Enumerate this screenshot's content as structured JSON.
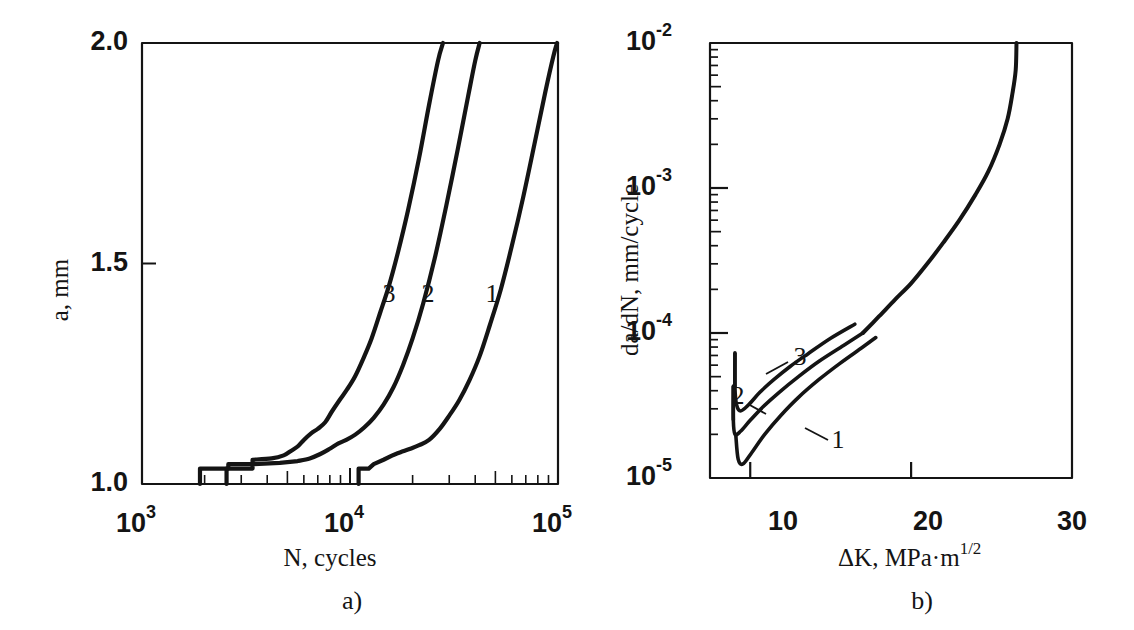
{
  "figure": {
    "width": 1134,
    "height": 630,
    "background": "#ffffff",
    "ink": "#141414"
  },
  "panels": [
    {
      "id": "panel-a",
      "caption": "a)",
      "caption_x": 352,
      "caption_y": 603,
      "frame": {
        "x": 142,
        "y": 43,
        "w": 416,
        "h": 441
      },
      "axis_label_x": "N, cycles",
      "axis_label_x_pos": {
        "x": 330,
        "y": 560
      },
      "axis_label_y": "a, mm",
      "axis_label_y_pos": {
        "x": 62,
        "y": 290
      },
      "xticks": [
        {
          "value": 1000,
          "label": "10",
          "exp": "3",
          "x": 142
        },
        {
          "value": 10000,
          "label": "10",
          "exp": "4",
          "x": 350
        },
        {
          "value": 100000,
          "label": "10",
          "exp": "5",
          "x": 558
        }
      ],
      "yticks": [
        {
          "value": 2.0,
          "label": "2.0",
          "y": 43
        },
        {
          "value": 1.5,
          "label": "1.5",
          "y": 264
        },
        {
          "value": 1.0,
          "label": "1.0",
          "y": 484
        }
      ],
      "curve_labels": [
        {
          "text": "3",
          "x": 389,
          "y": 296
        },
        {
          "text": "2",
          "x": 428,
          "y": 296
        },
        {
          "text": "1",
          "x": 492,
          "y": 296
        }
      ]
    },
    {
      "id": "panel-b",
      "caption": "b)",
      "caption_x": 922,
      "caption_y": 603,
      "frame": {
        "x": 710,
        "y": 43,
        "w": 362,
        "h": 435
      },
      "axis_label_x": "ΔK, MPa·m",
      "axis_label_x_sup": "1/2",
      "axis_label_x_pos": {
        "x": 838,
        "y": 560
      },
      "axis_label_y": "da/dN, mm/cycle",
      "axis_label_y_pos": {
        "x": 632,
        "y": 270
      },
      "xticks": [
        {
          "value": 10,
          "label": "10",
          "x": 783
        },
        {
          "value": 20,
          "label": "20",
          "x": 928
        },
        {
          "value": 30,
          "label": "30",
          "x": 1072
        }
      ],
      "yticks": [
        {
          "value": 0.01,
          "label": "10",
          "exp": "-2",
          "y": 43
        },
        {
          "value": 0.001,
          "label": "10",
          "exp": "-3",
          "y": 188
        },
        {
          "value": 0.0001,
          "label": "10",
          "exp": "-4",
          "y": 333
        },
        {
          "value": 1e-05,
          "label": "10",
          "exp": "-5",
          "y": 478
        }
      ],
      "curve_labels": [
        {
          "text": "3",
          "x": 800,
          "y": 359,
          "leader": [
            788,
            362,
            766,
            374
          ]
        },
        {
          "text": "2",
          "x": 738,
          "y": 398,
          "leader": [
            748,
            404,
            766,
            414
          ]
        },
        {
          "text": "1",
          "x": 838,
          "y": 442,
          "leader": [
            828,
            440,
            805,
            428
          ]
        }
      ]
    }
  ],
  "chart_data": [
    {
      "type": "line",
      "id": "crack-growth-vs-cycles",
      "title": "",
      "xlabel": "N, cycles",
      "ylabel": "a, mm",
      "xscale": "log",
      "yscale": "linear",
      "xlim": [
        1000,
        100000
      ],
      "ylim": [
        1.0,
        2.0
      ],
      "xticks": [
        1000,
        10000,
        100000
      ],
      "yticks": [
        1.0,
        1.5,
        2.0
      ],
      "grid": false,
      "legend": "inline-curve-numbers",
      "series": [
        {
          "name": "3",
          "points": [
            [
              1900,
              1.0
            ],
            [
              1900,
              1.035
            ],
            [
              2600,
              1.035
            ],
            [
              2600,
              1.045
            ],
            [
              3400,
              1.045
            ],
            [
              3400,
              1.055
            ],
            [
              4200,
              1.058
            ],
            [
              4800,
              1.065
            ],
            [
              5200,
              1.075
            ],
            [
              5600,
              1.085
            ],
            [
              6000,
              1.1
            ],
            [
              6500,
              1.115
            ],
            [
              7000,
              1.125
            ],
            [
              7600,
              1.14
            ],
            [
              8200,
              1.165
            ],
            [
              8900,
              1.19
            ],
            [
              9700,
              1.215
            ],
            [
              10600,
              1.245
            ],
            [
              11600,
              1.285
            ],
            [
              12700,
              1.33
            ],
            [
              14000,
              1.39
            ],
            [
              15400,
              1.45
            ],
            [
              17000,
              1.525
            ],
            [
              19000,
              1.62
            ],
            [
              21500,
              1.74
            ],
            [
              24000,
              1.86
            ],
            [
              26500,
              1.96
            ],
            [
              28000,
              2.0
            ]
          ]
        },
        {
          "name": "2",
          "points": [
            [
              2550,
              1.0
            ],
            [
              2550,
              1.035
            ],
            [
              3400,
              1.035
            ],
            [
              3400,
              1.045
            ],
            [
              4600,
              1.048
            ],
            [
              5600,
              1.052
            ],
            [
              6400,
              1.058
            ],
            [
              7200,
              1.068
            ],
            [
              8000,
              1.08
            ],
            [
              8800,
              1.092
            ],
            [
              9600,
              1.1
            ],
            [
              10600,
              1.112
            ],
            [
              11700,
              1.128
            ],
            [
              13000,
              1.15
            ],
            [
              14500,
              1.18
            ],
            [
              16200,
              1.22
            ],
            [
              18000,
              1.27
            ],
            [
              20000,
              1.33
            ],
            [
              22500,
              1.41
            ],
            [
              25500,
              1.51
            ],
            [
              29000,
              1.63
            ],
            [
              33000,
              1.76
            ],
            [
              37000,
              1.88
            ],
            [
              40000,
              1.96
            ],
            [
              42000,
              2.0
            ]
          ]
        },
        {
          "name": "1",
          "points": [
            [
              11000,
              1.0
            ],
            [
              11000,
              1.035
            ],
            [
              12300,
              1.035
            ],
            [
              13000,
              1.045
            ],
            [
              14500,
              1.055
            ],
            [
              16000,
              1.065
            ],
            [
              17500,
              1.072
            ],
            [
              19500,
              1.08
            ],
            [
              21500,
              1.088
            ],
            [
              24000,
              1.1
            ],
            [
              27000,
              1.125
            ],
            [
              30000,
              1.155
            ],
            [
              33500,
              1.19
            ],
            [
              37500,
              1.235
            ],
            [
              42000,
              1.29
            ],
            [
              47000,
              1.36
            ],
            [
              53000,
              1.44
            ],
            [
              60000,
              1.54
            ],
            [
              68000,
              1.65
            ],
            [
              77000,
              1.77
            ],
            [
              87000,
              1.89
            ],
            [
              95000,
              1.97
            ],
            [
              99000,
              2.0
            ]
          ]
        }
      ]
    },
    {
      "type": "line",
      "id": "crack-growth-rate-vs-deltaK",
      "title": "",
      "xlabel": "ΔK, MPa·m^1/2",
      "ylabel": "da/dN, mm/cycle",
      "xscale": "linear",
      "yscale": "log",
      "xlim": [
        7.5,
        30
      ],
      "ylim": [
        1e-05,
        0.01
      ],
      "xticks": [
        10,
        20,
        30
      ],
      "yticks": [
        1e-05,
        0.0001,
        0.001,
        0.01
      ],
      "grid": false,
      "legend": "inline-curve-numbers",
      "series": [
        {
          "name": "3",
          "points": [
            [
              9.05,
              7.3e-05
            ],
            [
              9.05,
              4.2e-05
            ],
            [
              9.15,
              3.2e-05
            ],
            [
              9.4,
              2.9e-05
            ],
            [
              9.9,
              3.2e-05
            ],
            [
              10.6,
              3.9e-05
            ],
            [
              11.5,
              4.8e-05
            ],
            [
              12.5,
              5.9e-05
            ],
            [
              13.6,
              7.2e-05
            ],
            [
              15.0,
              9.2e-05
            ],
            [
              16.5,
              0.000115
            ]
          ]
        },
        {
          "name": "2",
          "points": [
            [
              8.95,
              4.3e-05
            ],
            [
              8.95,
              2.5e-05
            ],
            [
              9.05,
              2e-05
            ],
            [
              9.4,
              2.1e-05
            ],
            [
              10.0,
              2.5e-05
            ],
            [
              10.8,
              3.1e-05
            ],
            [
              11.8,
              3.9e-05
            ],
            [
              13.0,
              5e-05
            ],
            [
              14.3,
              6.4e-05
            ],
            [
              15.8,
              8.2e-05
            ],
            [
              17.0,
              0.0001
            ]
          ]
        },
        {
          "name": "1",
          "points": [
            [
              9.1,
              2e-05
            ],
            [
              9.25,
              1.35e-05
            ],
            [
              9.55,
              1.25e-05
            ],
            [
              10.1,
              1.5e-05
            ],
            [
              10.9,
              2e-05
            ],
            [
              11.9,
              2.7e-05
            ],
            [
              13.0,
              3.6e-05
            ],
            [
              14.3,
              4.8e-05
            ],
            [
              15.6,
              6.2e-05
            ],
            [
              17.0,
              8e-05
            ],
            [
              17.8,
              9.3e-05
            ]
          ]
        },
        {
          "name": "master",
          "points": [
            [
              17.0,
              0.0001
            ],
            [
              18.0,
              0.00013
            ],
            [
              19.0,
              0.00017
            ],
            [
              20.0,
              0.00022
            ],
            [
              21.0,
              0.0003
            ],
            [
              22.0,
              0.00042
            ],
            [
              23.0,
              0.0006
            ],
            [
              24.0,
              0.0009
            ],
            [
              24.8,
              0.0013
            ],
            [
              25.5,
              0.002
            ],
            [
              26.0,
              0.003
            ],
            [
              26.3,
              0.0045
            ],
            [
              26.5,
              0.0065
            ],
            [
              26.55,
              0.01
            ]
          ]
        }
      ]
    }
  ]
}
